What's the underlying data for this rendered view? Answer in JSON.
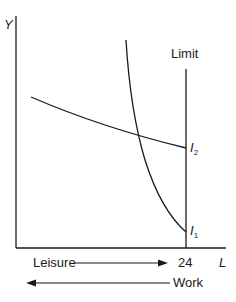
{
  "diagram": {
    "y_axis_label": "Y",
    "x_axis_label": "L",
    "limit_label": "Limit",
    "limit_tick_label": "24",
    "curves": [
      {
        "id": "I1",
        "label_main": "I",
        "label_sub": "1",
        "shape": "steep convex curve ending on limit line near bottom"
      },
      {
        "id": "I2",
        "label_main": "I",
        "label_sub": "2",
        "shape": "shallow downward curve ending on limit line"
      }
    ],
    "leisure_label": "Leisure",
    "leisure_direction": "right",
    "work_label": "Work",
    "work_direction": "left",
    "line_color": "#1a1a1a",
    "background": "#ffffff"
  }
}
